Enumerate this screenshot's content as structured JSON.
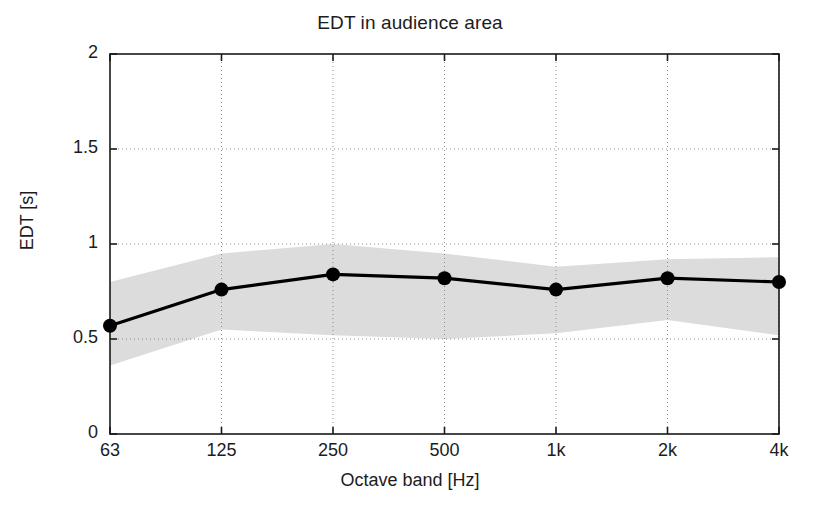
{
  "chart_data": {
    "type": "line",
    "title": "EDT in audience area",
    "xlabel": "Octave band [Hz]",
    "ylabel": "EDT [s]",
    "categories": [
      "63",
      "125",
      "250",
      "500",
      "1k",
      "2k",
      "4k"
    ],
    "xtick_labels": [
      "63",
      "125",
      "250",
      "500",
      "1k",
      "2k",
      "4k"
    ],
    "ytick_labels": [
      "0",
      "0.5",
      "1",
      "1.5",
      "2"
    ],
    "ytick_values": [
      0,
      0.5,
      1,
      1.5,
      2
    ],
    "ylim": [
      0,
      2
    ],
    "xlim": [
      0,
      6
    ],
    "grid": true,
    "grid_style": "dotted",
    "legend": null,
    "series": [
      {
        "name": "EDT mean",
        "style": "line-with-markers",
        "marker": "filled-circle",
        "color": "#000000",
        "values": [
          0.57,
          0.76,
          0.84,
          0.82,
          0.76,
          0.82,
          0.8
        ]
      },
      {
        "name": "EDT spread band upper",
        "style": "shaded-band-edge",
        "color": "#d9d9d9",
        "values": [
          0.8,
          0.95,
          1.0,
          0.95,
          0.88,
          0.92,
          0.93
        ]
      },
      {
        "name": "EDT spread band lower",
        "style": "shaded-band-edge",
        "color": "#d9d9d9",
        "values": [
          0.36,
          0.55,
          0.52,
          0.5,
          0.53,
          0.6,
          0.52
        ]
      }
    ],
    "band_fill_color": "#dcdcdc",
    "axis_color": "#1a1a1a",
    "background_color": "#ffffff"
  }
}
